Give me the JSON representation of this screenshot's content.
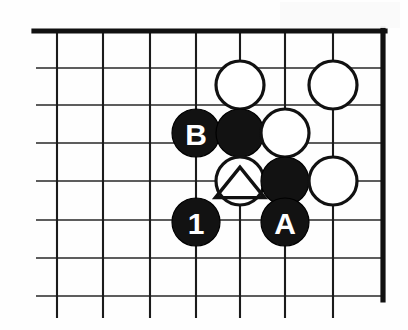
{
  "diagram": {
    "board": {
      "type": "go-board",
      "corner": "top-right",
      "grid": {
        "cell_size": 46,
        "row_spacing": 38,
        "origin_x": 57,
        "origin_y": 31,
        "columns": 8,
        "rows": 7,
        "edge_top_y": 31,
        "edge_right_x": 383
      },
      "colors": {
        "black_stone": "#121212",
        "white_stone": "#ffffff",
        "line": "#1b1b1b",
        "edge": "#111111",
        "background": "#ffffff"
      }
    },
    "stones": [
      {
        "id": "w1",
        "color": "white",
        "cx": 240,
        "cy": 85,
        "r": 24,
        "label": "",
        "marker": "none"
      },
      {
        "id": "w2",
        "color": "white",
        "cx": 333,
        "cy": 85,
        "r": 24,
        "label": "",
        "marker": "none"
      },
      {
        "id": "b1",
        "color": "black",
        "cx": 196,
        "cy": 133,
        "r": 24,
        "label": "B",
        "marker": "none"
      },
      {
        "id": "b2",
        "color": "black",
        "cx": 240,
        "cy": 133,
        "r": 24,
        "label": "",
        "marker": "none"
      },
      {
        "id": "w3",
        "color": "white",
        "cx": 285,
        "cy": 133,
        "r": 24,
        "label": "",
        "marker": "none"
      },
      {
        "id": "w4",
        "color": "white",
        "cx": 240,
        "cy": 181,
        "r": 24,
        "label": "",
        "marker": "triangle"
      },
      {
        "id": "b3",
        "color": "black",
        "cx": 285,
        "cy": 181,
        "r": 24,
        "label": "",
        "marker": "none"
      },
      {
        "id": "w5",
        "color": "white",
        "cx": 333,
        "cy": 181,
        "r": 24,
        "label": "",
        "marker": "none"
      },
      {
        "id": "b4",
        "color": "black",
        "cx": 196,
        "cy": 222,
        "r": 24,
        "label": "1",
        "marker": "none"
      },
      {
        "id": "b5",
        "color": "black",
        "cx": 285,
        "cy": 222,
        "r": 24,
        "label": "A",
        "marker": "none"
      }
    ],
    "labels": {
      "move_one": "1",
      "point_a": "A",
      "point_b": "B",
      "marked_stone_symbol": "triangle"
    }
  }
}
